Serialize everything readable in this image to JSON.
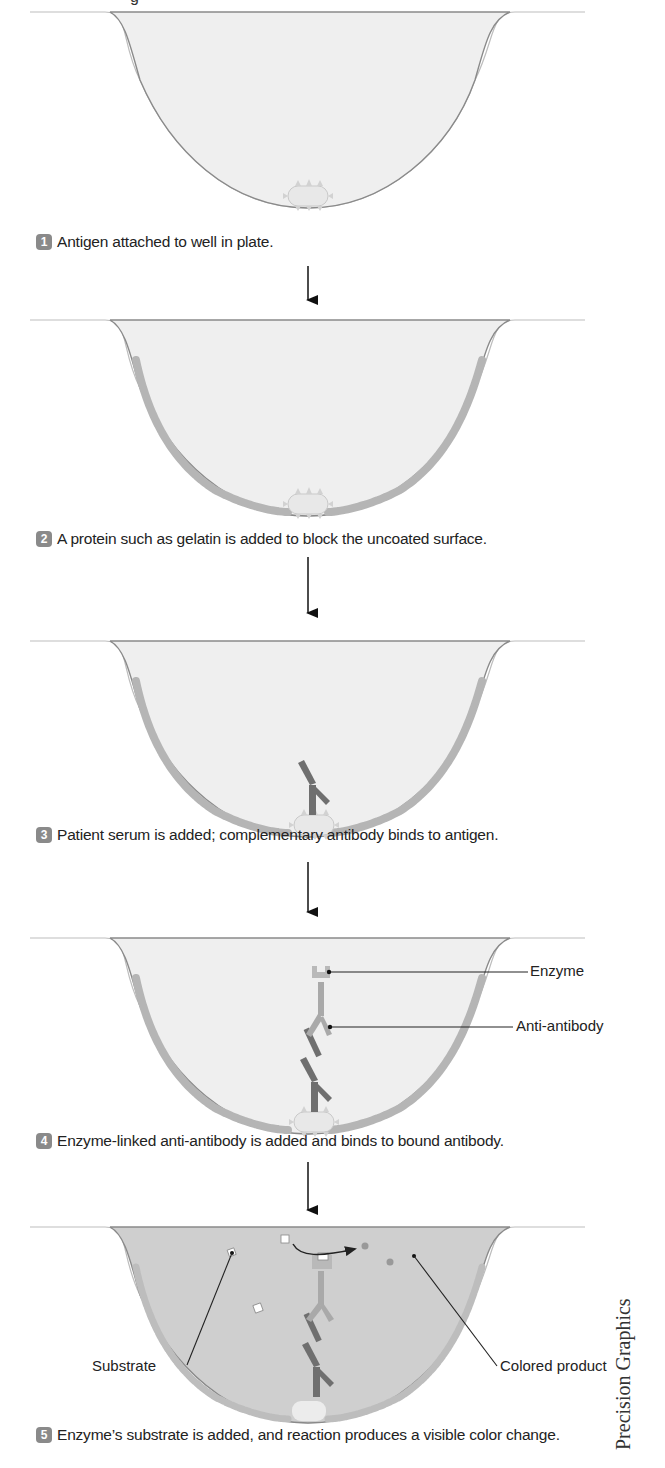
{
  "figure": {
    "title_fragment": "g",
    "credit": "Precision Graphics",
    "colors": {
      "well_outline": "#8a8a8a",
      "liquid_light": "#ececec",
      "liquid_colored": "#cfcfcf",
      "blocking_protein": "#b5b5b5",
      "antigen": "#e8e8e8",
      "antibody": "#6f6f6f",
      "anti_antibody": "#a9a9a9",
      "step_badge": "#8a8a8a",
      "arrow": "#111111"
    },
    "steps": [
      {
        "number": "1",
        "caption": "Antigen attached to well in plate."
      },
      {
        "number": "2",
        "caption": "A protein such as gelatin is added to block the uncoated surface."
      },
      {
        "number": "3",
        "caption": "Patient serum is added; complementary antibody binds to antigen."
      },
      {
        "number": "4",
        "caption": "Enzyme-linked anti-antibody is added and binds to bound antibody."
      },
      {
        "number": "5",
        "caption": "Enzyme’s substrate is added, and reaction produces a visible color change."
      }
    ],
    "labels": {
      "enzyme": "Enzyme",
      "anti_antibody": "Anti-antibody",
      "substrate": "Substrate",
      "colored_product": "Colored product"
    }
  }
}
